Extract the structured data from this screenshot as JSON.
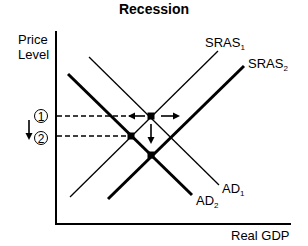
{
  "title": "Recession",
  "axes": {
    "y_label_line1": "Price",
    "y_label_line2": "Level",
    "x_label": "Real GDP"
  },
  "curves": {
    "sras1": {
      "base": "SRAS",
      "sub": "1"
    },
    "sras2": {
      "base": "SRAS",
      "sub": "2"
    },
    "ad1": {
      "base": "AD",
      "sub": "1"
    },
    "ad2": {
      "base": "AD",
      "sub": "2"
    }
  },
  "price_markers": {
    "p1": "1",
    "p2": "2"
  },
  "colors": {
    "line": "#000000",
    "background": "#ffffff"
  }
}
